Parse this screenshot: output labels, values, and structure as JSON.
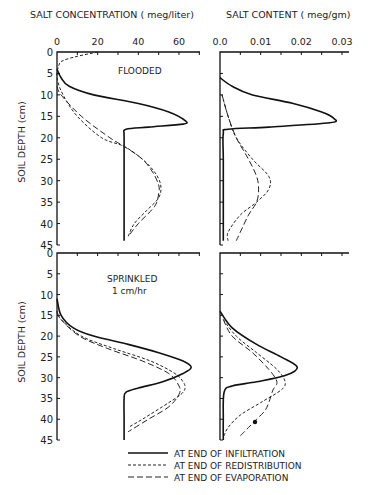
{
  "chart_data": [
    {
      "type": "line",
      "panel": "top-left",
      "title": "FLOODED",
      "xlabel": "SALT CONCENTRATION (meg/liter)",
      "ylabel": "SOIL DEPTH (cm)",
      "xlim": [
        0,
        70
      ],
      "ylim": [
        45,
        0
      ],
      "xticks": [
        0,
        20,
        40,
        60
      ],
      "yticks": [
        0,
        5,
        10,
        15,
        20,
        25,
        30,
        35,
        40,
        45
      ],
      "series": [
        {
          "name": "AT END OF INFILTRATION",
          "style": "solid",
          "depth": [
            4,
            6,
            8,
            10,
            12,
            14,
            16,
            16.8,
            17.5,
            18,
            19,
            20,
            25,
            30,
            35,
            40,
            44
          ],
          "values": [
            0,
            2,
            6,
            18,
            40,
            55,
            63,
            62,
            45,
            34,
            33,
            33,
            33,
            33,
            33,
            33,
            33
          ]
        },
        {
          "name": "AT END OF REDISTRIBUTION",
          "style": "dotted",
          "depth": [
            0,
            1,
            2,
            3,
            6,
            10,
            15,
            20,
            22,
            25,
            28,
            31,
            34,
            37,
            40,
            43
          ],
          "values": [
            20,
            10,
            3,
            1,
            0,
            3,
            10,
            22,
            33,
            42,
            48,
            51,
            50,
            44,
            38,
            35
          ]
        },
        {
          "name": "AT END OF EVAPORATION",
          "style": "dashed",
          "depth": [
            8,
            10,
            15,
            20,
            22,
            25,
            28,
            31,
            33,
            36,
            40,
            43
          ],
          "values": [
            0,
            2,
            12,
            26,
            33,
            42,
            47,
            50,
            50,
            48,
            40,
            35
          ]
        }
      ]
    },
    {
      "type": "line",
      "panel": "top-right",
      "title": "FLOODED",
      "xlabel": "SALT CONTENT (meg/gm)",
      "xlim": [
        0,
        0.033
      ],
      "ylim": [
        45,
        0
      ],
      "xticks": [
        0.0,
        0.01,
        0.02,
        0.03
      ],
      "series": [
        {
          "name": "AT END OF INFILTRATION",
          "style": "solid",
          "depth": [
            6,
            8,
            10,
            12,
            14,
            15.5,
            16.5,
            17.5,
            18,
            19,
            25,
            35,
            44
          ],
          "values": [
            0,
            0.003,
            0.008,
            0.018,
            0.025,
            0.028,
            0.027,
            0.012,
            0.002,
            0.0008,
            0.0008,
            0.0008,
            0.0008
          ]
        },
        {
          "name": "AT END OF REDISTRIBUTION",
          "style": "dotted",
          "depth": [
            10,
            15,
            20,
            25,
            29,
            32,
            35,
            38,
            42,
            44
          ],
          "values": [
            0.0005,
            0.002,
            0.004,
            0.008,
            0.012,
            0.012,
            0.009,
            0.005,
            0.002,
            0.002
          ]
        },
        {
          "name": "AT END OF EVAPORATION",
          "style": "dashed",
          "depth": [
            10,
            15,
            20,
            25,
            29,
            32,
            35,
            38,
            42,
            44
          ],
          "values": [
            0.0005,
            0.002,
            0.004,
            0.007,
            0.009,
            0.0095,
            0.009,
            0.007,
            0.005,
            0.004
          ]
        }
      ]
    },
    {
      "type": "line",
      "panel": "bottom-left",
      "title": "SPRINKLED 1 cm/hr",
      "xlabel": "SALT CONCENTRATION (meg/liter)",
      "ylabel": "SOIL DEPTH (cm)",
      "xlim": [
        0,
        70
      ],
      "ylim": [
        45,
        0
      ],
      "yticks": [
        0,
        5,
        10,
        15,
        20,
        25,
        30,
        35,
        40,
        45
      ],
      "series": [
        {
          "name": "AT END OF INFILTRATION",
          "style": "solid",
          "depth": [
            11,
            15,
            18,
            20,
            22,
            24,
            26,
            27.5,
            29,
            31,
            32.5,
            33.5,
            35,
            40,
            45
          ],
          "values": [
            0,
            2,
            8,
            18,
            35,
            50,
            62,
            66,
            62,
            52,
            40,
            34,
            33,
            33,
            33
          ]
        },
        {
          "name": "AT END OF REDISTRIBUTION",
          "style": "dotted",
          "depth": [
            14,
            16,
            20,
            23,
            26,
            29,
            31,
            32.5,
            34,
            36,
            40,
            42
          ],
          "values": [
            0,
            2,
            12,
            28,
            46,
            58,
            62,
            63,
            61,
            55,
            42,
            35
          ]
        },
        {
          "name": "AT END OF EVAPORATION",
          "style": "dashed",
          "depth": [
            14,
            16,
            20,
            23,
            26,
            29,
            32,
            34,
            37,
            40,
            43
          ],
          "values": [
            0,
            2,
            11,
            25,
            42,
            55,
            60,
            60,
            55,
            45,
            35
          ]
        }
      ]
    },
    {
      "type": "line",
      "panel": "bottom-right",
      "title": "SPRINKLED 1 cm/hr",
      "xlabel": "SALT CONTENT (meg/gm)",
      "xlim": [
        0,
        0.033
      ],
      "ylim": [
        45,
        0
      ],
      "series": [
        {
          "name": "AT END OF INFILTRATION",
          "style": "solid",
          "depth": [
            14,
            18,
            22,
            25,
            27.5,
            29.5,
            31,
            32,
            33.5,
            40,
            45
          ],
          "values": [
            0,
            0.003,
            0.009,
            0.015,
            0.019,
            0.016,
            0.009,
            0.003,
            0.001,
            0.0008,
            0.0008
          ]
        },
        {
          "name": "AT END OF REDISTRIBUTION",
          "style": "dotted",
          "depth": [
            16,
            20,
            24,
            28,
            31,
            33,
            36,
            39,
            42,
            44
          ],
          "values": [
            0.0008,
            0.004,
            0.009,
            0.014,
            0.016,
            0.015,
            0.01,
            0.005,
            0.002,
            0.001
          ]
        },
        {
          "name": "AT END OF EVAPORATION",
          "style": "dashed",
          "depth": [
            16,
            20,
            24,
            28,
            31,
            33,
            36,
            38,
            40,
            42,
            44
          ],
          "values": [
            0.0008,
            0.003,
            0.008,
            0.012,
            0.014,
            0.013,
            0.012,
            0.011,
            0.009,
            0.007,
            0.005
          ]
        }
      ]
    }
  ],
  "labels": {
    "x_top_left": "SALT CONCENTRATION ( meg/liter)",
    "x_top_right": "SALT CONTENT ( meg/gm)",
    "y_label": "SOIL DEPTH (cm)",
    "flooded": "FLOODED",
    "sprinkled": "SPRINKLED",
    "rate": "1 cm/hr",
    "xticks_left": [
      "0",
      "20",
      "40",
      "60"
    ],
    "xticks_right": [
      "0.0",
      "0.01",
      "0.02",
      "0.03"
    ],
    "yticks": [
      "0",
      "5",
      "10",
      "15",
      "20",
      "25",
      "30",
      "35",
      "40",
      "45"
    ]
  },
  "legend": [
    {
      "label": "AT END OF INFILTRATION",
      "style": "solid"
    },
    {
      "label": "AT END OF REDISTRIBUTION",
      "style": "dotted"
    },
    {
      "label": "AT END OF EVAPORATION",
      "style": "dashed"
    }
  ]
}
